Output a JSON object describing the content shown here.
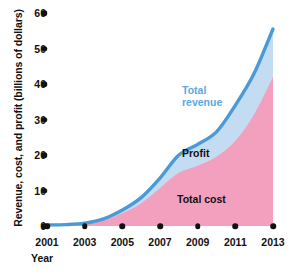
{
  "chart_data": {
    "type": "area",
    "title": "",
    "subtitle": "",
    "xlabel": "Year",
    "ylabel": "Revenue, cost, and profit (billions of dollars)",
    "x": [
      2001,
      2002,
      2003,
      2004,
      2005,
      2006,
      2007,
      2008,
      2009,
      2010,
      2011,
      2012,
      2013
    ],
    "xticklabels": [
      "2001",
      "2003",
      "2005",
      "2007",
      "2009",
      "2011",
      "2013"
    ],
    "xtickvalues": [
      2001,
      2003,
      2005,
      2007,
      2009,
      2011,
      2013
    ],
    "yticklabels": [
      "0",
      "10",
      "20",
      "30",
      "40",
      "50",
      "60"
    ],
    "ytickvalues": [
      0,
      10,
      20,
      30,
      40,
      50,
      60
    ],
    "xlim": [
      2001,
      2013
    ],
    "ylim": [
      0,
      60
    ],
    "grid": false,
    "legend_position": "in-plot annotations",
    "stacked": true,
    "series": [
      {
        "name": "Total revenue",
        "role": "upper-boundary-line",
        "color": "#4a9ad8",
        "fill": "#c3dcf2",
        "values": [
          0.3,
          0.4,
          0.8,
          2.0,
          4.5,
          8.0,
          13.5,
          20.0,
          23.0,
          26.5,
          34.0,
          43.0,
          55.5
        ]
      },
      {
        "name": "Total cost",
        "role": "lower-area",
        "color": "#f2a0be",
        "fill": "#f2a0be",
        "values": [
          0.2,
          0.3,
          0.6,
          1.6,
          3.6,
          6.4,
          10.7,
          15.0,
          17.0,
          19.5,
          24.0,
          31.5,
          42.0
        ]
      },
      {
        "name": "Profit",
        "role": "band-between-cost-and-revenue",
        "color": "#c3dcf2",
        "values": [
          0.1,
          0.1,
          0.2,
          0.4,
          0.9,
          1.6,
          2.8,
          5.0,
          6.0,
          7.0,
          10.0,
          11.5,
          13.5
        ]
      }
    ],
    "annotations": [
      {
        "text": "Total revenue",
        "color": "#5aa9e0"
      },
      {
        "text": "Profit",
        "color": "#111111"
      },
      {
        "text": "Total cost",
        "color": "#111111"
      }
    ]
  },
  "axes": {
    "y_title": "Revenue, cost, and profit (billions of dollars)",
    "x_title": "Year",
    "y_ticks": [
      {
        "label": "60",
        "value": 60
      },
      {
        "label": "50",
        "value": 50
      },
      {
        "label": "40",
        "value": 40
      },
      {
        "label": "30",
        "value": 30
      },
      {
        "label": "20",
        "value": 20
      },
      {
        "label": "10",
        "value": 10
      },
      {
        "label": "0",
        "value": 0
      }
    ],
    "x_ticks": [
      {
        "label": "2001",
        "value": 2001
      },
      {
        "label": "2003",
        "value": 2003
      },
      {
        "label": "2005",
        "value": 2005
      },
      {
        "label": "2007",
        "value": 2007
      },
      {
        "label": "2009",
        "value": 2009
      },
      {
        "label": "2011",
        "value": 2011
      },
      {
        "label": "2013",
        "value": 2013
      }
    ]
  },
  "labels": {
    "revenue_line1": "Total",
    "revenue_line2": "revenue",
    "profit": "Profit",
    "cost": "Total cost"
  },
  "colors": {
    "revenue_line": "#4a9ad8",
    "revenue_fill": "#c3dcf2",
    "cost_fill": "#f2a0be",
    "revenue_label": "#5aa9e0",
    "text": "#111111",
    "background": "#ffffff"
  }
}
